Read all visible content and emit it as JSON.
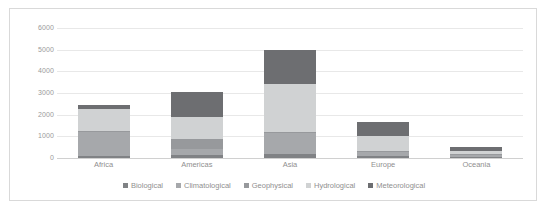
{
  "chart_data": {
    "type": "bar",
    "subtype": "stacked-column",
    "title": "",
    "subtitle": "",
    "xlabel": "",
    "ylabel": "",
    "categories": [
      "Africa",
      "Americas",
      "Asia",
      "Europe",
      "Oceania"
    ],
    "ylim": [
      0,
      6000
    ],
    "ytick_labels": [
      "6000",
      "5000",
      "4000",
      "3000",
      "2000",
      "1000",
      "0"
    ],
    "ytick_values": [
      6000,
      5000,
      4000,
      3000,
      2000,
      1000,
      0
    ],
    "grid": true,
    "legend_position": "bottom",
    "series": [
      {
        "name": "Biological",
        "color": "#808285",
        "values": [
          110,
          150,
          200,
          110,
          40
        ]
      },
      {
        "name": "Climatological",
        "color": "#a6a8ab",
        "values": [
          1090,
          250,
          980,
          180,
          100
        ]
      },
      {
        "name": "Geophysical",
        "color": "#97999c",
        "values": [
          60,
          500,
          40,
          30,
          40
        ]
      },
      {
        "name": "Hydrological",
        "color": "#d0d2d3",
        "values": [
          990,
          1000,
          2180,
          680,
          150
        ]
      },
      {
        "name": "Meteorological",
        "color": "#6d6e71",
        "values": [
          200,
          1150,
          1600,
          650,
          200
        ]
      }
    ],
    "totals": [
      2450,
      3050,
      5000,
      1650,
      530
    ]
  },
  "legend": {
    "entries": [
      {
        "label": "Biological",
        "color": "#808285"
      },
      {
        "label": "Climatological",
        "color": "#a6a8ab"
      },
      {
        "label": "Geophysical",
        "color": "#97999c"
      },
      {
        "label": "Hydrological",
        "color": "#d0d2d3"
      },
      {
        "label": "Meteorological",
        "color": "#6d6e71"
      }
    ]
  },
  "style": {
    "plot_background": "#ffffff",
    "border_color": "#d9d9d9",
    "gridline_color": "#e8e8e8",
    "tick_text_color": "#9a9a9a",
    "label_text_color": "#8f8f8f"
  }
}
